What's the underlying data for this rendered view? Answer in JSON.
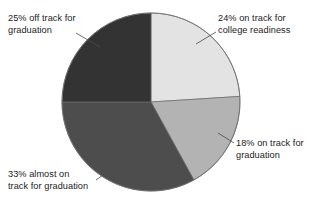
{
  "chart_data": {
    "type": "pie",
    "title": "",
    "subtitle": "",
    "xlabel": "",
    "ylabel": "",
    "legend_position": "none",
    "grid": false,
    "start_angle_deg": 0,
    "direction": "clockwise",
    "total": 100,
    "units": "percent",
    "categories": [
      "on track for college readiness",
      "on track for graduation",
      "almost on track for graduation",
      "off track for graduation"
    ],
    "values": [
      24,
      18,
      33,
      25
    ],
    "labels": [
      "24% on track for\ncollege readiness",
      "18% on track for\ngraduation",
      "33% almost on\ntrack for graduation",
      "25% off track for\ngraduation"
    ],
    "colors": [
      "#e3e3e3",
      "#b3b3b3",
      "#4d4d4d",
      "#333333"
    ],
    "slice_outline_color": "#555555"
  },
  "slices": [
    {
      "name": "on-track-college-readiness",
      "value": 24,
      "label": "24% on track for\ncollege readiness",
      "color": "#e3e3e3",
      "start_deg": 0,
      "end_deg": 86.4
    },
    {
      "name": "on-track-graduation",
      "value": 18,
      "label": "18% on track for\ngraduation",
      "color": "#b3b3b3",
      "start_deg": 86.4,
      "end_deg": 151.2
    },
    {
      "name": "almost-on-track-graduation",
      "value": 33,
      "label": "33% almost on\ntrack for graduation",
      "color": "#4d4d4d",
      "start_deg": 151.2,
      "end_deg": 270.0
    },
    {
      "name": "off-track-graduation",
      "value": 25,
      "label": "25% off track for\ngraduation",
      "color": "#333333",
      "start_deg": 270.0,
      "end_deg": 360.0
    }
  ],
  "geometry": {
    "center_x": 151,
    "center_y": 102,
    "radius": 89
  },
  "colors": {
    "background": "#ffffff",
    "text": "#1b1b1b",
    "leader_line": "#4a4a4a"
  }
}
